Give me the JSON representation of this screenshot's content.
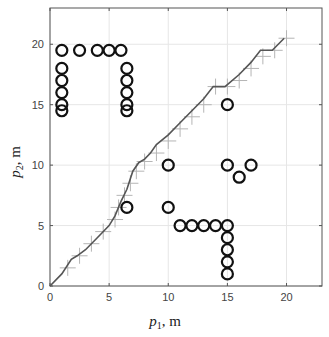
{
  "chart_data": {
    "type": "scatter",
    "title": "",
    "xlabel": "p1, m",
    "ylabel": "p2, m",
    "xlabel_parts": {
      "base": "p",
      "sub": "1",
      "unit": ", m"
    },
    "ylabel_parts": {
      "base": "p",
      "sub": "2",
      "unit": ", m"
    },
    "xlim": [
      0,
      23
    ],
    "ylim": [
      0,
      23
    ],
    "xticks": [
      0,
      5,
      10,
      15,
      20
    ],
    "yticks": [
      0,
      5,
      10,
      15,
      20
    ],
    "grid": true,
    "legend": null,
    "series": [
      {
        "name": "obstacles",
        "marker": "circle",
        "points": [
          [
            1,
            19.5
          ],
          [
            2.5,
            19.5
          ],
          [
            4,
            19.5
          ],
          [
            5,
            19.5
          ],
          [
            6,
            19.5
          ],
          [
            1,
            18
          ],
          [
            1,
            17
          ],
          [
            1,
            16
          ],
          [
            1,
            15
          ],
          [
            1,
            14.5
          ],
          [
            6.5,
            18
          ],
          [
            6.5,
            17
          ],
          [
            6.5,
            16
          ],
          [
            6.5,
            15
          ],
          [
            6.5,
            14.5
          ],
          [
            15,
            15
          ],
          [
            10,
            10
          ],
          [
            15,
            10
          ],
          [
            16,
            9
          ],
          [
            17,
            10
          ],
          [
            6.5,
            6.5
          ],
          [
            10,
            6.5
          ],
          [
            11,
            5
          ],
          [
            12,
            5
          ],
          [
            13,
            5
          ],
          [
            14,
            5
          ],
          [
            15,
            5
          ],
          [
            15,
            4
          ],
          [
            15,
            3
          ],
          [
            15,
            2
          ],
          [
            15,
            1
          ]
        ]
      },
      {
        "name": "path",
        "marker": "line",
        "points": [
          [
            0,
            0
          ],
          [
            1,
            1
          ],
          [
            1.8,
            2.2
          ],
          [
            2.3,
            2.5
          ],
          [
            3,
            3
          ],
          [
            4,
            4
          ],
          [
            5,
            5
          ],
          [
            5.5,
            5.8
          ],
          [
            6,
            7
          ],
          [
            6.5,
            8
          ],
          [
            7,
            9.5
          ],
          [
            7.5,
            10.2
          ],
          [
            8,
            10.5
          ],
          [
            8.5,
            11
          ],
          [
            9,
            11.7
          ],
          [
            10,
            12.5
          ],
          [
            11,
            13.5
          ],
          [
            12,
            14.5
          ],
          [
            13,
            15.5
          ],
          [
            13.8,
            16.5
          ],
          [
            14.8,
            16.5
          ],
          [
            16,
            17.5
          ],
          [
            17,
            18.5
          ],
          [
            17.8,
            19.5
          ],
          [
            18.8,
            19.5
          ],
          [
            19.8,
            20.5
          ]
        ]
      },
      {
        "name": "waypoints",
        "marker": "plus",
        "points": [
          [
            1.5,
            1.5
          ],
          [
            2.5,
            2.5
          ],
          [
            3.5,
            3.5
          ],
          [
            4.5,
            4.5
          ],
          [
            5.5,
            5.5
          ],
          [
            5.8,
            6.5
          ],
          [
            6.3,
            7.5
          ],
          [
            6.8,
            8.5
          ],
          [
            7.3,
            9.5
          ],
          [
            8,
            10.3
          ],
          [
            9,
            11
          ],
          [
            10,
            12
          ],
          [
            11,
            13
          ],
          [
            12,
            14
          ],
          [
            13,
            15
          ],
          [
            14,
            16.5
          ],
          [
            15,
            16.5
          ],
          [
            16,
            17
          ],
          [
            17,
            18
          ],
          [
            18,
            19
          ],
          [
            19,
            19.5
          ],
          [
            20,
            20.5
          ]
        ]
      }
    ]
  }
}
